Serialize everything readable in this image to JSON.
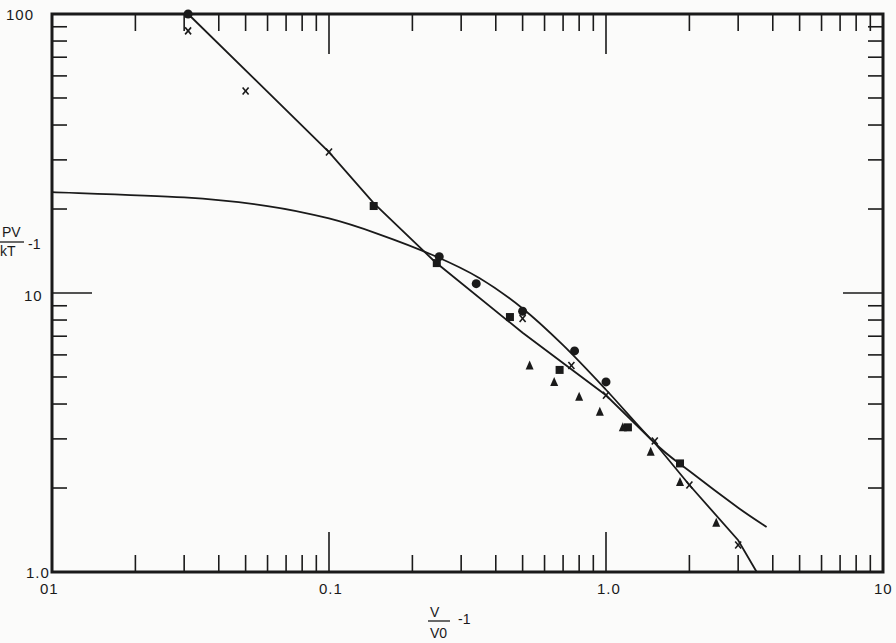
{
  "chart_data": {
    "type": "scatter",
    "title": "",
    "xlabel": "V/V0 - 1",
    "ylabel": "PV/kT - 1",
    "xscale": "log",
    "yscale": "log",
    "xlim": [
      0.01,
      10
    ],
    "ylim": [
      1.0,
      100
    ],
    "grid": false,
    "legend": null,
    "x_tick_labels": [
      ".01",
      "0.1",
      "1.0",
      "10"
    ],
    "y_tick_labels": [
      "1.0",
      "10",
      "100"
    ],
    "series": [
      {
        "name": "circles",
        "marker": "circle",
        "points": [
          [
            0.031,
            100
          ],
          [
            0.25,
            13.5
          ],
          [
            0.34,
            10.8
          ],
          [
            0.5,
            8.6
          ],
          [
            0.77,
            6.2
          ],
          [
            1.0,
            4.8
          ]
        ]
      },
      {
        "name": "crosses",
        "marker": "x",
        "points": [
          [
            0.031,
            87
          ],
          [
            0.05,
            53
          ],
          [
            0.1,
            32
          ],
          [
            0.5,
            8.1
          ],
          [
            0.75,
            5.5
          ],
          [
            1.0,
            4.3
          ],
          [
            1.5,
            2.95
          ],
          [
            2.0,
            2.05
          ],
          [
            3.0,
            1.25
          ]
        ]
      },
      {
        "name": "squares",
        "marker": "square",
        "points": [
          [
            0.145,
            20.5
          ],
          [
            0.245,
            12.8
          ],
          [
            0.45,
            8.2
          ],
          [
            0.68,
            5.3
          ],
          [
            1.2,
            3.3
          ],
          [
            1.85,
            2.45
          ]
        ]
      },
      {
        "name": "triangles",
        "marker": "triangle",
        "points": [
          [
            0.53,
            5.5
          ],
          [
            0.65,
            4.8
          ],
          [
            0.8,
            4.25
          ],
          [
            0.95,
            3.75
          ],
          [
            1.15,
            3.3
          ],
          [
            1.45,
            2.7
          ],
          [
            1.85,
            2.1
          ],
          [
            2.5,
            1.5
          ]
        ]
      }
    ],
    "curves": [
      {
        "name": "straight-line-fit",
        "style": "line",
        "points": [
          [
            0.031,
            100
          ],
          [
            0.1,
            32
          ],
          [
            0.145,
            21
          ],
          [
            0.24,
            13
          ],
          [
            0.5,
            7.2
          ],
          [
            1.0,
            4.3
          ],
          [
            1.5,
            2.9
          ],
          [
            2.0,
            2.05
          ],
          [
            3.0,
            1.3
          ],
          [
            3.5,
            1.0
          ]
        ]
      },
      {
        "name": "theory-curve",
        "style": "line",
        "points": [
          [
            0.01,
            23
          ],
          [
            0.03,
            22
          ],
          [
            0.06,
            20.5
          ],
          [
            0.1,
            18.5
          ],
          [
            0.15,
            16.3
          ],
          [
            0.24,
            13.6
          ],
          [
            0.35,
            11.3
          ],
          [
            0.5,
            8.8
          ],
          [
            0.7,
            6.5
          ],
          [
            1.0,
            4.5
          ],
          [
            1.5,
            2.9
          ],
          [
            2.0,
            2.3
          ],
          [
            3.0,
            1.7
          ],
          [
            3.8,
            1.45
          ]
        ]
      }
    ]
  },
  "labels": {
    "y_axis_numerator": "PV",
    "y_axis_denominator": "kT",
    "y_axis_suffix": "-1",
    "x_axis_numerator": "V",
    "x_axis_denominator": "V0",
    "x_axis_suffix": "-1",
    "y_100": "100",
    "y_10": "10",
    "y_1": "1.0",
    "x_001": "01",
    "x_01": "0.1",
    "x_1": "1.0",
    "x_10": "10"
  }
}
